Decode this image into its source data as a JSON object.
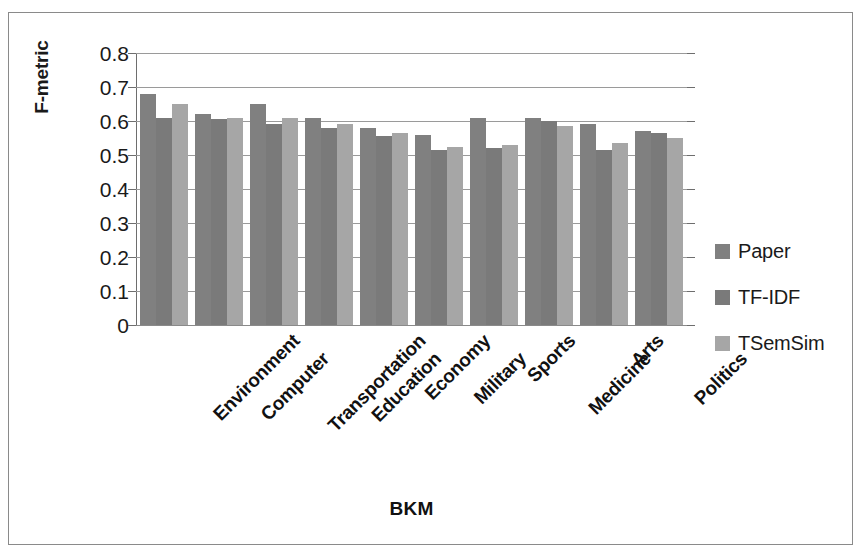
{
  "chart_data": {
    "type": "bar",
    "title": "",
    "xlabel": "BKM",
    "ylabel": "F-metric",
    "ylim": [
      0,
      0.8
    ],
    "ytick_values": [
      0.8,
      0.7,
      0.6,
      0.5,
      0.4,
      0.3,
      0.2,
      0.1,
      0
    ],
    "ytick_labels": [
      "0.8",
      "0.7",
      "0.6",
      "0.5",
      "0.4",
      "0.3",
      "0.2",
      "0.1",
      "0"
    ],
    "grid": true,
    "grid_axis": "y",
    "legend_position": "right",
    "categories": [
      "Environment",
      "Computer",
      "Transportation",
      "Education",
      "Economy",
      "Military",
      "Sports",
      "Medicine",
      "Arts",
      "Politics"
    ],
    "series": [
      {
        "name": "Paper",
        "color": "#808080",
        "values": [
          0.68,
          0.62,
          0.65,
          0.61,
          0.58,
          0.56,
          0.61,
          0.61,
          0.59,
          0.57
        ]
      },
      {
        "name": "TF-IDF",
        "color": "#7a7a7a",
        "values": [
          0.61,
          0.605,
          0.59,
          0.58,
          0.555,
          0.515,
          0.52,
          0.6,
          0.515,
          0.565
        ]
      },
      {
        "name": "TSemSim",
        "color": "#a6a6a6",
        "values": [
          0.65,
          0.61,
          0.61,
          0.59,
          0.565,
          0.525,
          0.53,
          0.585,
          0.535,
          0.55
        ]
      }
    ]
  },
  "legend": {
    "items": [
      {
        "label": "Paper",
        "color": "#808080"
      },
      {
        "label": "TF-IDF",
        "color": "#7a7a7a"
      },
      {
        "label": "TSemSim",
        "color": "#a6a6a6"
      }
    ]
  },
  "axis_titles": {
    "x": "BKM",
    "y": "F-metric"
  }
}
